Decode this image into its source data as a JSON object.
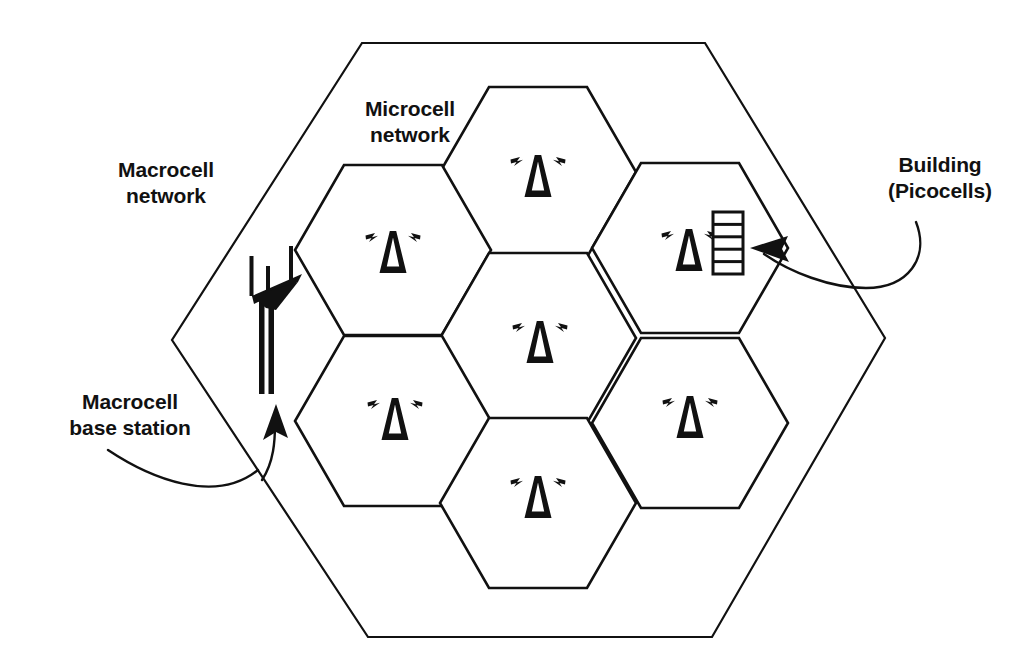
{
  "diagram": {
    "background_color": "#ffffff",
    "line_color": "#111111",
    "labels": {
      "macrocell_network": "Macrocell\nnetwork",
      "microcell_network": "Microcell\nnetwork",
      "building_picocells": "Building\n(Picocells)",
      "macrocell_base_station": "Macrocell\nbase station"
    },
    "macrocell": {
      "name": "macrocell-boundary",
      "shape": "hexagon",
      "stroke_width": 2,
      "vertices": [
        [
          362,
          43
        ],
        [
          705,
          43
        ],
        [
          885,
          338
        ],
        [
          712,
          637
        ],
        [
          368,
          637
        ],
        [
          172,
          340
        ]
      ]
    },
    "microcells": [
      {
        "id": "microcell-top",
        "center": [
          538,
          172
        ],
        "antenna": true,
        "building": false
      },
      {
        "id": "microcell-upper-left",
        "center": [
          393,
          250
        ],
        "antenna": true,
        "building": false
      },
      {
        "id": "microcell-upper-right",
        "center": [
          690,
          248
        ],
        "antenna": true,
        "building": true
      },
      {
        "id": "microcell-center",
        "center": [
          538,
          338
        ],
        "antenna": true,
        "building": false
      },
      {
        "id": "microcell-lower-left",
        "center": [
          393,
          421
        ],
        "antenna": true,
        "building": false
      },
      {
        "id": "microcell-lower-right",
        "center": [
          690,
          423
        ],
        "antenna": true,
        "building": false
      },
      {
        "id": "microcell-bottom",
        "center": [
          538,
          503
        ],
        "antenna": true,
        "building": false
      }
    ],
    "microcell_geometry": {
      "shape": "hexagon",
      "orientation": "flat-top",
      "radius": 98,
      "stroke_width": 2
    },
    "base_station": {
      "name": "macrocell-base-station-tower",
      "position": [
        265,
        340
      ],
      "description": "lattice mast with horizontal cross-arm and three vertical antenna elements"
    },
    "building": {
      "name": "picocell-building",
      "position": [
        728,
        242
      ],
      "floors": 5,
      "description": "multi-storey building containing picocells"
    },
    "callouts": [
      {
        "id": "callout-base-station",
        "label_ref": "macrocell_base_station",
        "arrow_direction": "up",
        "arrow_tip": [
          278,
          408
        ]
      },
      {
        "id": "callout-building",
        "label_ref": "building_picocells",
        "arrow_direction": "left",
        "arrow_tip": [
          753,
          250
        ]
      }
    ],
    "icons": {
      "antenna": "antenna-tower-icon",
      "building": "building-icon",
      "base_station": "base-station-mast-icon",
      "arrow": "arrowhead-icon"
    }
  }
}
